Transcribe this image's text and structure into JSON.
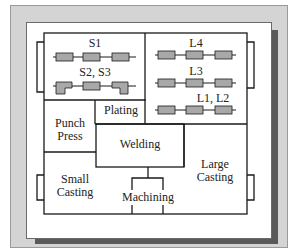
{
  "diagram": {
    "type": "facility-layout",
    "colors": {
      "frame": "#d4d4d4",
      "shadow": "#5a5a5a",
      "panel": "#ffffff",
      "lines": "#1a1a1a",
      "machine_fill": "#a8a8a8"
    },
    "areas": {
      "s1": "S1",
      "s23": "S2, S3",
      "l4": "L4",
      "l3": "L3",
      "l12": "L1, L2",
      "punch": "Punch",
      "press": "Press",
      "plating": "Plating",
      "welding": "Welding",
      "small1": "Small",
      "small2": "Casting",
      "machining": "Machining",
      "large1": "Large",
      "large2": "Casting"
    },
    "lines": {
      "small_parts": [
        "S1",
        "S2, S3"
      ],
      "large_parts": [
        "L4",
        "L3",
        "L1, L2"
      ],
      "machines_per_line": 3
    }
  }
}
